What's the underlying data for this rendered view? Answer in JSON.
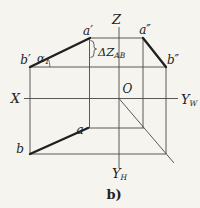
{
  "figure": {
    "type": "descriptive-geometry projection diagram",
    "background_color": "#f5f4ef",
    "line_color": "#474747",
    "thick_line_color": "#1f1f1f",
    "caption": "b)"
  },
  "axes": {
    "z_label": "Z",
    "x_label": "X",
    "y_w_label": {
      "main": "Y",
      "sub": "W"
    },
    "y_h_label": {
      "main": "Y",
      "sub": "H"
    },
    "origin_label": "O"
  },
  "points": {
    "a_front": "a′",
    "a_side": "a″",
    "b_front": "b′",
    "b_side": "b″",
    "a_top": "a",
    "b_top": "b"
  },
  "annotations": {
    "angle": {
      "main": "α",
      "sub": "1"
    },
    "delta_z": {
      "main": "ΔZ",
      "sub": "AB"
    }
  }
}
